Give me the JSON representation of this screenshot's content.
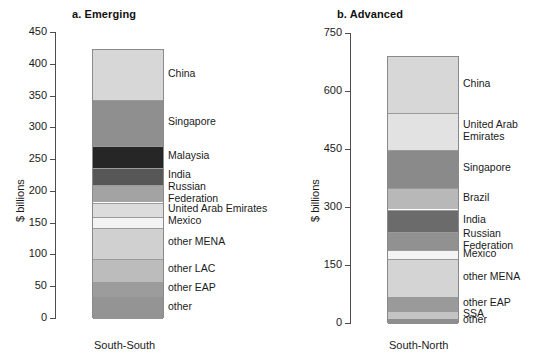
{
  "figure": {
    "ylabel": "$ billions"
  },
  "chart_data": [
    {
      "type": "bar",
      "stacked": true,
      "title": "a. Emerging",
      "xlabel": "",
      "ylabel": "$ billions",
      "categories": [
        "South-South"
      ],
      "ylim": [
        0,
        450
      ],
      "yticks": [
        0,
        50,
        100,
        150,
        200,
        250,
        300,
        350,
        400,
        450
      ],
      "grid": false,
      "total": 423,
      "series": [
        {
          "name": "China",
          "value": 78,
          "cumulative_top": 423,
          "color": "#d7d7d7"
        },
        {
          "name": "Singapore",
          "value": 73,
          "cumulative_top": 345,
          "color": "#8f8f8f"
        },
        {
          "name": "Malaysia",
          "value": 34,
          "cumulative_top": 272,
          "color": "#262626"
        },
        {
          "name": "India",
          "value": 28,
          "cumulative_top": 238,
          "color": "#575757"
        },
        {
          "name": "Russian\nFederation",
          "value": 27,
          "cumulative_top": 210,
          "color": "#a3a3a3"
        },
        {
          "name": "United Arab Emirates",
          "value": 23,
          "cumulative_top": 183,
          "color": "#dcdcdc"
        },
        {
          "name": "Mexico",
          "value": 17,
          "cumulative_top": 160,
          "color": "#f3f3f3"
        },
        {
          "name": "other MENA",
          "value": 49,
          "cumulative_top": 143,
          "color": "#d0d0d0"
        },
        {
          "name": "other LAC",
          "value": 36,
          "cumulative_top": 94,
          "color": "#bcbcbc"
        },
        {
          "name": "other EAP",
          "value": 23,
          "cumulative_top": 58,
          "color": "#9c9c9c"
        },
        {
          "name": "other",
          "value": 35,
          "cumulative_top": 35,
          "color": "#949494"
        }
      ]
    },
    {
      "type": "bar",
      "stacked": true,
      "title": "b. Advanced",
      "xlabel": "",
      "ylabel": "$ billions",
      "categories": [
        "South-North"
      ],
      "ylim": [
        0,
        750
      ],
      "yticks": [
        0,
        150,
        300,
        450,
        600,
        750
      ],
      "grid": false,
      "total": 690,
      "series": [
        {
          "name": "China",
          "value": 145,
          "cumulative_top": 690,
          "color": "#d7d7d7"
        },
        {
          "name": "United Arab\nEmirates",
          "value": 95,
          "cumulative_top": 545,
          "color": "#e2e2e2"
        },
        {
          "name": "Singapore",
          "value": 100,
          "cumulative_top": 450,
          "color": "#8a8a8a"
        },
        {
          "name": "Brazil",
          "value": 55,
          "cumulative_top": 350,
          "color": "#b8b8b8"
        },
        {
          "name": "India",
          "value": 58,
          "cumulative_top": 295,
          "color": "#6b6b6b"
        },
        {
          "name": "Russian\nFederation",
          "value": 47,
          "cumulative_top": 237,
          "color": "#919191"
        },
        {
          "name": "Mexico",
          "value": 22,
          "cumulative_top": 190,
          "color": "#f4f4f4"
        },
        {
          "name": "other MENA",
          "value": 98,
          "cumulative_top": 168,
          "color": "#d4d4d4"
        },
        {
          "name": "other EAP",
          "value": 38,
          "cumulative_top": 70,
          "color": "#9a9a9a"
        },
        {
          "name": "SSA",
          "value": 20,
          "cumulative_top": 32,
          "color": "#c4c4c4"
        },
        {
          "name": "other",
          "value": 12,
          "cumulative_top": 12,
          "color": "#8e8e8e"
        }
      ]
    }
  ]
}
